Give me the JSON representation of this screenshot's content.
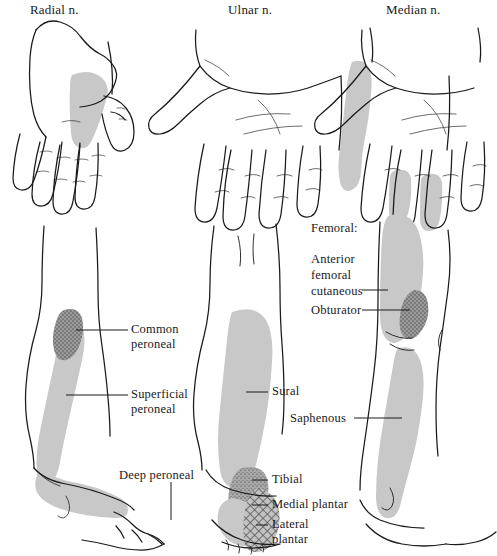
{
  "figure": {
    "kind": "anatomy-illustration",
    "fill_colors": {
      "light_gray": "#c8c8c8",
      "mid_gray": "#ababab",
      "dark_gray": "#8a8a8a",
      "outline": "#1a1a1a",
      "background": "#ffffff"
    }
  },
  "hands": {
    "radial": {
      "label": "Radial n.",
      "view": "dorsal"
    },
    "ulnar": {
      "label": "Ulnar n.",
      "view": "palmar"
    },
    "median": {
      "label": "Median n.",
      "view": "palmar"
    }
  },
  "legs": {
    "left": {
      "view": "lateral",
      "labels": [
        {
          "id": "common-peroneal",
          "line1": "Common",
          "line2": "peroneal"
        },
        {
          "id": "superficial-peroneal",
          "line1": "Superficial",
          "line2": "peroneal"
        },
        {
          "id": "deep-peroneal",
          "line1": "Deep peroneal",
          "line2": ""
        }
      ]
    },
    "middle": {
      "view": "posterior",
      "labels": [
        {
          "id": "sural",
          "line1": "Sural",
          "line2": ""
        },
        {
          "id": "tibial",
          "line1": "Tibial",
          "line2": ""
        },
        {
          "id": "medial-plantar",
          "line1": "Medial plantar",
          "line2": ""
        },
        {
          "id": "lateral-plantar",
          "line1": "Lateral",
          "line2": "plantar"
        }
      ]
    },
    "right": {
      "view": "medial",
      "group_heading": "Femoral:",
      "labels": [
        {
          "id": "anterior-femoral-cutaneous",
          "line1": "Anterior",
          "line2": "femoral",
          "line3": "cutaneous"
        },
        {
          "id": "obturator",
          "line1": "Obturator",
          "line2": ""
        },
        {
          "id": "saphenous",
          "line1": "Saphenous",
          "line2": ""
        }
      ]
    }
  }
}
